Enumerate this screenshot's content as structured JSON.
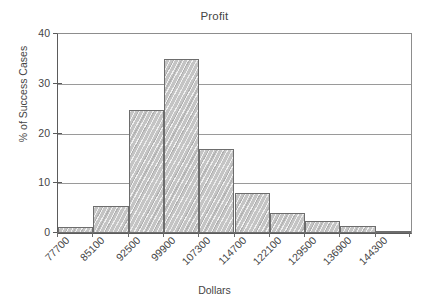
{
  "chart_data": {
    "type": "bar",
    "title": "Profit",
    "xlabel": "Dollars",
    "ylabel": "% of Success Cases",
    "categories": [
      "77700",
      "85100",
      "92500",
      "99900",
      "107300",
      "114700",
      "122100",
      "129500",
      "136900",
      "144300"
    ],
    "values": [
      1.2,
      5.4,
      24.8,
      35.0,
      16.8,
      8.1,
      4.0,
      2.5,
      1.4,
      0.3
    ],
    "ylim": [
      0,
      40
    ],
    "yticks": [
      0,
      10,
      20,
      30,
      40
    ],
    "ytick_labels": [
      "0",
      "10",
      "20",
      "30",
      "40"
    ],
    "grid": true,
    "grid_axis": "y",
    "legend": "none",
    "bar_fill_color": "#c4c4c4",
    "bar_edge_color": "#6d6d6d",
    "axis_color": "#5b5b5b",
    "grid_color": "#9a9a9a",
    "text_color": "#454545",
    "background_color": "#ffffff",
    "xtick_rotation": -45,
    "bar_gap": 0
  }
}
